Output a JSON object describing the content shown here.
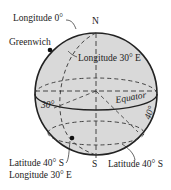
{
  "diagram": {
    "colors": {
      "sphere_fill": "#d9d9d9",
      "stroke": "#222222",
      "background": "#ffffff"
    },
    "labels": {
      "north": "N",
      "south": "S",
      "longitude_0": "Longitude 0°",
      "greenwich": "Greenwich",
      "longitude_30e": "Longitude 30° E",
      "equator": "Equator",
      "angle_30": "30°",
      "angle_40": "40°",
      "point_lat": "Latitude 40° S",
      "point_lon": "Longitude 30° E",
      "latitude_40s": "Latitude 40° S"
    }
  }
}
